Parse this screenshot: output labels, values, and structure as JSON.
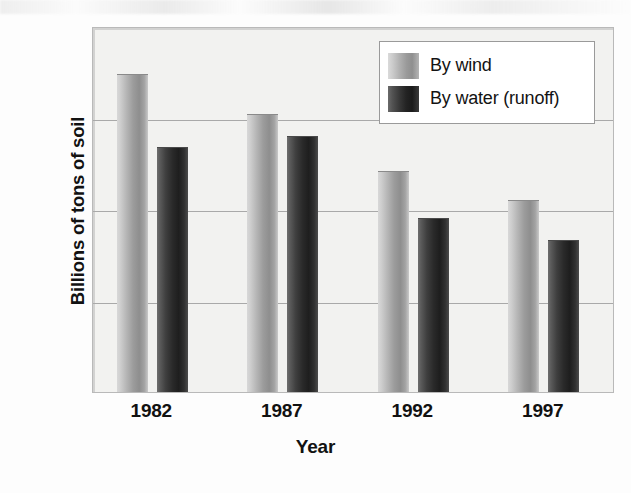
{
  "chart_data": {
    "type": "bar",
    "title": "",
    "xlabel": "Year",
    "ylabel": "Billions of tons of soil",
    "categories": [
      "1982",
      "1987",
      "1992",
      "1997"
    ],
    "series": [
      {
        "name": "By wind",
        "values": [
          1.74,
          1.52,
          1.21,
          1.05
        ],
        "color": "#a0a0a0"
      },
      {
        "name": "By water (runoff)",
        "values": [
          1.34,
          1.4,
          0.95,
          0.83
        ],
        "color": "#2a2a2a"
      }
    ],
    "ylim": [
      0,
      2.0
    ],
    "yticks": [
      "0",
      "0.5",
      "1.0",
      "1.5",
      "2.0"
    ],
    "ytick_values": [
      0,
      0.5,
      1.0,
      1.5,
      2.0
    ],
    "grid": true,
    "legend_position": "top-right"
  },
  "axes": {
    "y_title": "Billions of tons of soil",
    "x_title": "Year",
    "y_ticks": [
      {
        "label": "2.0",
        "value": 2.0
      },
      {
        "label": "1.5",
        "value": 1.5
      },
      {
        "label": "1.0",
        "value": 1.0
      },
      {
        "label": "0.5",
        "value": 0.5
      },
      {
        "label": "0",
        "value": 0
      }
    ],
    "x_ticks": [
      "1982",
      "1987",
      "1992",
      "1997"
    ]
  },
  "legend": {
    "entries": [
      {
        "label": "By wind",
        "swatch": "wind"
      },
      {
        "label": "By water (runoff)",
        "swatch": "water"
      }
    ]
  }
}
